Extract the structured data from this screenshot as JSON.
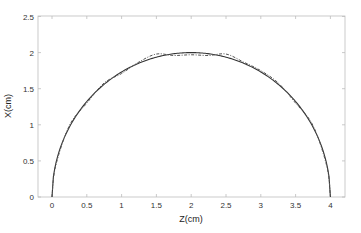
{
  "chart_data": {
    "type": "line",
    "title": "",
    "xlabel": "Z(cm)",
    "ylabel": "X(cm)",
    "xlim": [
      -0.2,
      4.2
    ],
    "ylim": [
      0,
      2.5
    ],
    "xticks": [
      0,
      0.5,
      1,
      1.5,
      2,
      2.5,
      3,
      3.5,
      4
    ],
    "xtick_labels": [
      "0",
      "0.5",
      "1",
      "1.5",
      "2",
      "2.5",
      "3",
      "3.5",
      "4"
    ],
    "yticks": [
      0,
      0.5,
      1,
      1.5,
      2,
      2.5
    ],
    "ytick_labels": [
      "0",
      "0.5",
      "1",
      "1.5",
      "2",
      "2.5"
    ],
    "grid": false,
    "legend": null,
    "series": [
      {
        "name": "semicircle (solid)",
        "style": "solid",
        "color": "#333333",
        "description": "x = sqrt(4 - (z-2)^2), z from 0 to 4",
        "x": [
          0,
          0.05,
          0.25,
          0.5,
          0.75,
          1,
          1.25,
          1.5,
          1.75,
          2,
          2.25,
          2.5,
          2.75,
          3,
          3.25,
          3.5,
          3.75,
          3.95,
          4
        ],
        "y": [
          0,
          0.44,
          0.97,
          1.32,
          1.56,
          1.73,
          1.85,
          1.94,
          1.98,
          2.0,
          1.98,
          1.94,
          1.85,
          1.73,
          1.56,
          1.32,
          0.97,
          0.44,
          0
        ]
      },
      {
        "name": "approximation (dashed)",
        "style": "dash-dot",
        "color": "#555555",
        "description": "wavy approximation oscillating around the semicircle",
        "x": [
          0,
          0.05,
          0.25,
          0.5,
          0.75,
          1,
          1.25,
          1.5,
          1.75,
          2,
          2.25,
          2.5,
          2.75,
          3,
          3.25,
          3.5,
          3.75,
          3.95,
          4
        ],
        "y": [
          0,
          0.42,
          0.99,
          1.3,
          1.58,
          1.71,
          1.87,
          1.98,
          1.96,
          1.97,
          1.96,
          1.98,
          1.87,
          1.75,
          1.58,
          1.3,
          0.99,
          0.42,
          0
        ]
      }
    ]
  }
}
